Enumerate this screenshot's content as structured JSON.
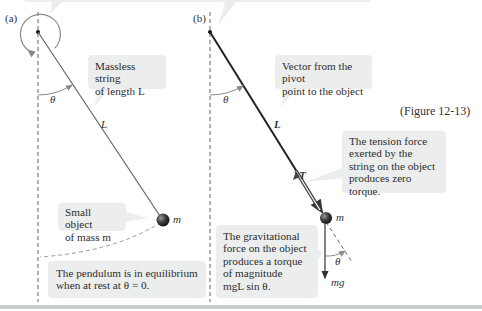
{
  "figure": {
    "number_label": "(Figure 12-13)",
    "panel_a": {
      "label": "(a)",
      "string_label": "L",
      "angle_label": "θ",
      "mass_label": "m",
      "callouts": {
        "string": [
          "Massless string",
          "of length L"
        ],
        "object": [
          "Small object",
          "of mass m"
        ],
        "equilibrium": [
          "The pendulum is in equilibrium",
          "when at rest at θ = 0."
        ]
      }
    },
    "panel_b": {
      "label": "(b)",
      "vector_L_label": "L⃗",
      "tension_label": "T⃗",
      "weight_label": "mg⃗",
      "angle_label_top": "θ",
      "angle_label_bottom": "θ",
      "mass_label": "m",
      "callouts": {
        "vector": [
          "Vector from the pivot",
          "point to the object"
        ],
        "tension": [
          "The tension force",
          "exerted by the",
          "string on the object",
          "produces zero",
          "torque."
        ],
        "gravity": [
          "The gravitational",
          "force on the object",
          "produces a torque",
          "of magnitude",
          "mgL sin θ."
        ]
      }
    },
    "colors": {
      "callout_bg": "#eceeee",
      "line": "#555555",
      "ball": "#3a3a3a",
      "rule": "#c9cccc"
    }
  }
}
